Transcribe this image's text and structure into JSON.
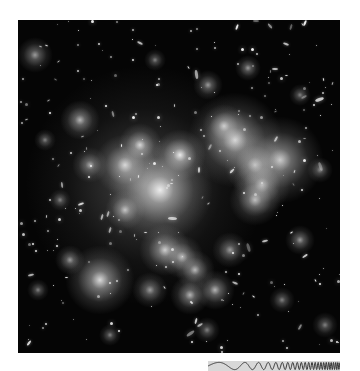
{
  "image": {
    "subject": "galaxy cluster deep-field",
    "background_color": "#050505",
    "page_background": "#ffffff"
  },
  "chirp_bar": {
    "background": "#d8d8d8",
    "stroke": "#333333",
    "description": "chirp wave with increasing frequency"
  },
  "glows": [
    {
      "x": 145,
      "y": 185,
      "r": 55,
      "a": 0.35
    },
    {
      "x": 160,
      "y": 190,
      "r": 24,
      "a": 0.9
    },
    {
      "x": 125,
      "y": 165,
      "r": 14,
      "a": 0.8
    },
    {
      "x": 180,
      "y": 155,
      "r": 12,
      "a": 0.9
    },
    {
      "x": 140,
      "y": 145,
      "r": 10,
      "a": 0.8
    },
    {
      "x": 235,
      "y": 140,
      "r": 22,
      "a": 0.85
    },
    {
      "x": 280,
      "y": 160,
      "r": 20,
      "a": 0.8
    },
    {
      "x": 255,
      "y": 165,
      "r": 14,
      "a": 0.7
    },
    {
      "x": 262,
      "y": 185,
      "r": 13,
      "a": 0.7
    },
    {
      "x": 255,
      "y": 200,
      "r": 12,
      "a": 0.7
    },
    {
      "x": 224,
      "y": 126,
      "r": 10,
      "a": 0.7
    },
    {
      "x": 100,
      "y": 280,
      "r": 16,
      "a": 0.85
    },
    {
      "x": 165,
      "y": 250,
      "r": 12,
      "a": 0.8
    },
    {
      "x": 182,
      "y": 257,
      "r": 10,
      "a": 0.7
    },
    {
      "x": 195,
      "y": 270,
      "r": 9,
      "a": 0.7
    },
    {
      "x": 150,
      "y": 290,
      "r": 8,
      "a": 0.6
    },
    {
      "x": 190,
      "y": 295,
      "r": 9,
      "a": 0.7
    },
    {
      "x": 215,
      "y": 290,
      "r": 9,
      "a": 0.7
    },
    {
      "x": 80,
      "y": 120,
      "r": 9,
      "a": 0.7
    },
    {
      "x": 90,
      "y": 165,
      "r": 8,
      "a": 0.6
    },
    {
      "x": 70,
      "y": 260,
      "r": 7,
      "a": 0.6
    },
    {
      "x": 125,
      "y": 210,
      "r": 9,
      "a": 0.7
    },
    {
      "x": 230,
      "y": 250,
      "r": 8,
      "a": 0.6
    },
    {
      "x": 300,
      "y": 240,
      "r": 7,
      "a": 0.6
    },
    {
      "x": 35,
      "y": 55,
      "r": 8,
      "a": 0.6
    },
    {
      "x": 208,
      "y": 85,
      "r": 7,
      "a": 0.6
    },
    {
      "x": 248,
      "y": 68,
      "r": 6,
      "a": 0.6
    },
    {
      "x": 155,
      "y": 60,
      "r": 5,
      "a": 0.5
    },
    {
      "x": 320,
      "y": 170,
      "r": 6,
      "a": 0.5
    },
    {
      "x": 282,
      "y": 300,
      "r": 6,
      "a": 0.5
    },
    {
      "x": 207,
      "y": 330,
      "r": 6,
      "a": 0.5
    },
    {
      "x": 38,
      "y": 290,
      "r": 5,
      "a": 0.5
    },
    {
      "x": 325,
      "y": 325,
      "r": 6,
      "a": 0.5
    },
    {
      "x": 60,
      "y": 200,
      "r": 5,
      "a": 0.5
    },
    {
      "x": 110,
      "y": 335,
      "r": 5,
      "a": 0.5
    },
    {
      "x": 300,
      "y": 95,
      "r": 5,
      "a": 0.5
    },
    {
      "x": 45,
      "y": 140,
      "r": 5,
      "a": 0.5
    }
  ],
  "star_count": 260
}
